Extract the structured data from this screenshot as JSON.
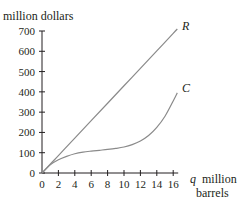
{
  "chart_data": {
    "type": "line",
    "title": "",
    "xlabel": "q million barrels",
    "xlabel_var": "q",
    "xlabel_line1": "million",
    "xlabel_line2": "barrels",
    "ylabel": "million dollars",
    "xlim": [
      0,
      16.5
    ],
    "ylim": [
      0,
      700
    ],
    "x_ticks": [
      0,
      2,
      4,
      6,
      8,
      10,
      12,
      14,
      16
    ],
    "y_ticks": [
      0,
      100,
      200,
      300,
      400,
      500,
      600,
      700
    ],
    "grid": false,
    "legend": "none; curves labeled directly at ends",
    "series": [
      {
        "name": "R",
        "x": [
          0,
          2,
          4,
          6,
          8,
          10,
          12,
          14,
          16,
          16.5
        ],
        "values": [
          0,
          86,
          172,
          258,
          344,
          430,
          516,
          602,
          688,
          710
        ]
      },
      {
        "name": "C",
        "x": [
          0,
          1,
          2,
          3,
          4,
          5,
          6,
          7,
          8,
          9,
          10,
          11,
          12,
          13,
          14,
          15,
          16,
          16.5
        ],
        "values": [
          0,
          40,
          65,
          82,
          95,
          103,
          108,
          112,
          116,
          121,
          128,
          140,
          158,
          185,
          225,
          280,
          355,
          395
        ]
      }
    ]
  },
  "labels": {
    "ylabel": "million dollars",
    "x_var": "q",
    "x_unit_1": "million",
    "x_unit_2": "barrels",
    "R": "R",
    "C": "C"
  }
}
